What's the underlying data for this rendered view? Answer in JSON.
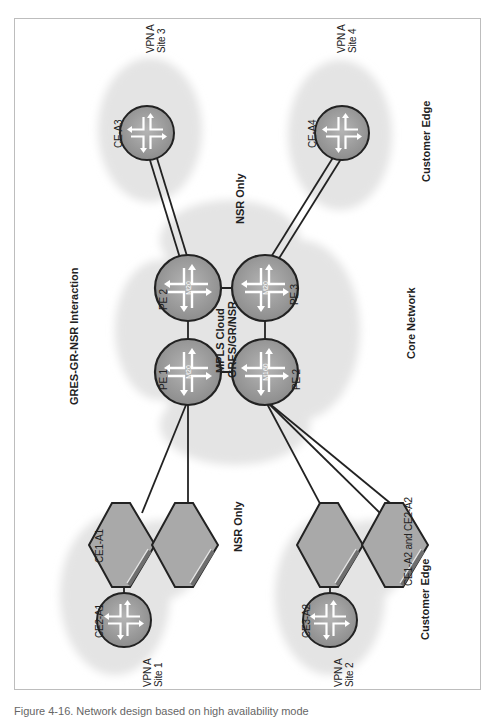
{
  "figure": {
    "title": "GRES-GR-NSR Interaction",
    "caption": "Figure 4-16. Network design based on high availability mode"
  },
  "zones": {
    "core": "Core Network",
    "customer_edge_top": "Customer Edge",
    "customer_edge_bottom": "Customer Edge",
    "nsr_only_top": "NSR Only",
    "nsr_only_bottom": "NSR Only"
  },
  "core_cloud": {
    "line1": "MPLS Cloud",
    "line2": "GRES/GR/NSR"
  },
  "pe_routers": [
    {
      "label": "PE 1",
      "model": "M20"
    },
    {
      "label": "PE 2",
      "model": "M20"
    },
    {
      "label": "PE 3",
      "model": "M20"
    },
    {
      "label": "PE 2",
      "model": "M160"
    }
  ],
  "ce_devices": {
    "ce_a3": "CE-A3",
    "ce_a4": "CE-A4",
    "ce1_a1": "CE1-A1",
    "ce2_a1": "CE2-A1",
    "ce3_a2": "CE3-A2",
    "ce1_ce2_a2": "CE1-A2 and CE2-A2"
  },
  "sites": [
    {
      "vpn": "VPN A",
      "site": "Site 1"
    },
    {
      "vpn": "VPN A",
      "site": "Site 2"
    },
    {
      "vpn": "VPN A",
      "site": "Site 3"
    },
    {
      "vpn": "VPN A",
      "site": "Site 4"
    }
  ],
  "colors": {
    "cloud": "#e6e6e6",
    "router_fill": "#9a9a9a",
    "router_inner": "#b8b8b8",
    "switch_fill": "#a8a8a8",
    "line": "#222222",
    "frame": "#bdbdbd"
  }
}
